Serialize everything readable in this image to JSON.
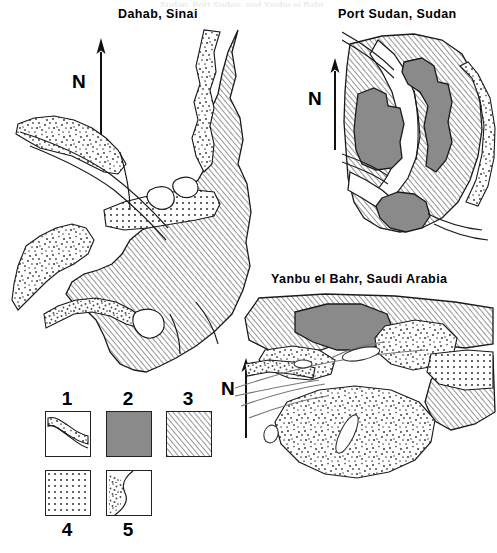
{
  "figure": {
    "type": "comparative coastal geomorphology maps",
    "page_artifact_text": "Sudan, Port Sudan, and Yanbu el Bahr",
    "maps": [
      {
        "id": "dahab",
        "title": "Dahab, Sinai",
        "north_label": "N"
      },
      {
        "id": "port-sudan",
        "title": "Port Sudan, Sudan",
        "north_label": "N"
      },
      {
        "id": "yanbu",
        "title": "Yanbu el Bahr, Saudi Arabia",
        "north_label": "N"
      }
    ]
  },
  "legend": {
    "items": [
      {
        "number": "1",
        "pattern": "stippled-band-along-shoreline",
        "label_position": "above"
      },
      {
        "number": "2",
        "pattern": "solid-gray-fill",
        "label_position": "above"
      },
      {
        "number": "3",
        "pattern": "diagonal-hatch",
        "label_position": "above"
      },
      {
        "number": "4",
        "pattern": "regular-dot-grid",
        "label_position": "below"
      },
      {
        "number": "5",
        "pattern": "stipple-band-along-curve",
        "label_position": "below"
      }
    ]
  },
  "colors": {
    "ink": "#1a1a1a",
    "solid_gray": "#8a8a8a",
    "hatch_line": "#6e6e6e",
    "stipple_dot": "#4a4a4a",
    "paper": "#ffffff"
  }
}
